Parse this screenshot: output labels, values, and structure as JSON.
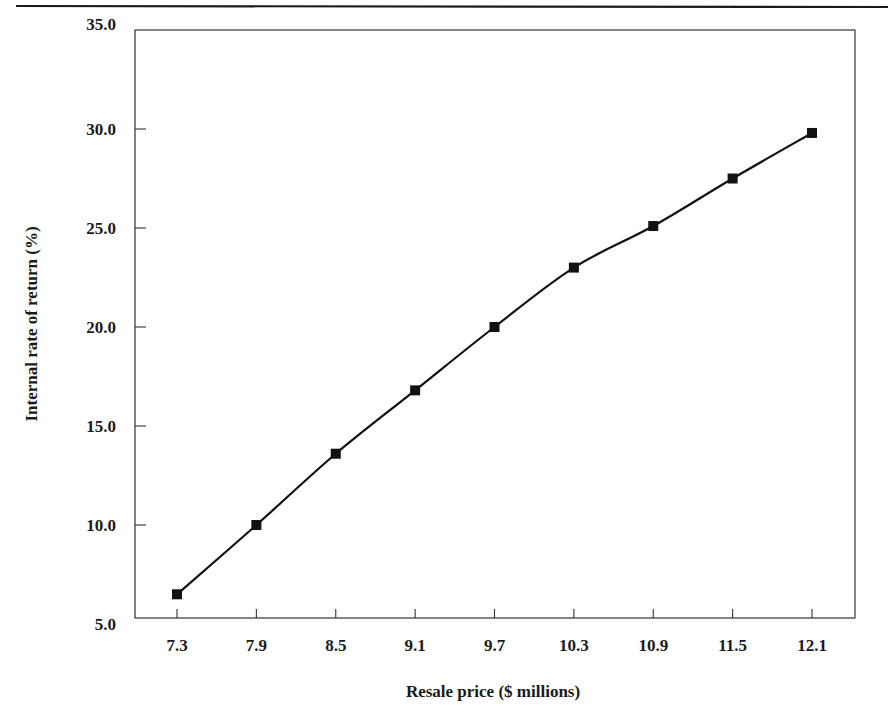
{
  "chart_data": {
    "type": "line",
    "title": "",
    "xlabel": "Resale price ($ millions)",
    "ylabel": "Internal rate of return (%)",
    "x": [
      7.3,
      7.9,
      8.5,
      9.1,
      9.7,
      10.3,
      10.9,
      11.5,
      12.1
    ],
    "categories": [
      "7.3",
      "7.9",
      "8.5",
      "9.1",
      "9.7",
      "10.3",
      "10.9",
      "11.5",
      "12.1"
    ],
    "series": [
      {
        "name": "Internal rate of return",
        "values": [
          6.5,
          10.0,
          13.6,
          16.8,
          20.0,
          23.0,
          25.1,
          27.5,
          29.8
        ],
        "marker": "square",
        "color": "#111111"
      }
    ],
    "ylim": [
      5.0,
      35.0
    ],
    "yticks": [
      "5.0",
      "10.0",
      "15.0",
      "20.0",
      "25.0",
      "30.0",
      "35.0"
    ],
    "grid": false,
    "legend": null
  },
  "style": {
    "line_color": "#111111",
    "axis_color": "#333333",
    "text_color": "#1a1a1a"
  }
}
